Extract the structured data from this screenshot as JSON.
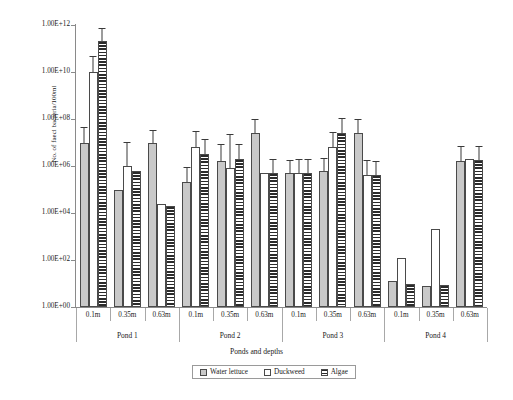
{
  "chart_data": {
    "type": "bar",
    "title": "",
    "xlabel": "Ponds and depths",
    "ylabel": "No. of faecl bacteria/100ml",
    "scale": "log10",
    "ylim": [
      1,
      1000000000000
    ],
    "ytick_labels": [
      "1.00E+12",
      "1.00E+10",
      "1.00E+08",
      "1.00E+06",
      "1.00E+04",
      "1.00E+02",
      "1.00E+00"
    ],
    "ytick_values": [
      1000000000000.0,
      10000000000.0,
      100000000.0,
      1000000.0,
      10000.0,
      100.0,
      1
    ],
    "grid": false,
    "legend_position": "bottom",
    "groups": [
      "Pond 1",
      "Pond 2",
      "Pond 3",
      "Pond 4"
    ],
    "depths": [
      "0.1m",
      "0.35m",
      "0.63m"
    ],
    "categories": [
      "Pond 1 0.1m",
      "Pond 1 0.35m",
      "Pond 1 0.63m",
      "Pond 2 0.1m",
      "Pond 2 0.35m",
      "Pond 2 0.63m",
      "Pond 3 0.1m",
      "Pond 3 0.35m",
      "Pond 3 0.63m",
      "Pond 4 0.1m",
      "Pond 4 0.35m",
      "Pond 4 0.63m"
    ],
    "series": [
      {
        "name": "Water lettuce",
        "pattern": "solid-gray",
        "color": "#c9c9c9",
        "log_values": [
          7.0,
          5.0,
          7.0,
          5.3,
          6.2,
          7.4,
          5.7,
          5.8,
          7.4,
          1.1,
          0.9,
          6.2
        ],
        "values": [
          10000000.0,
          100000.0,
          10000000.0,
          200000.0,
          1600000.0,
          25000000.0,
          500000.0,
          630000.0,
          25000000.0,
          12,
          8,
          1600000.0
        ],
        "err_up_log": [
          0.6,
          0.0,
          0.5,
          0.6,
          0.7,
          0.55,
          0.5,
          0.5,
          0.55,
          0.0,
          0.0,
          0.6
        ]
      },
      {
        "name": "Duckweed",
        "pattern": "open-white",
        "color": "#ffffff",
        "log_values": [
          10.0,
          6.0,
          4.4,
          6.8,
          5.9,
          5.7,
          5.7,
          6.8,
          5.6,
          2.1,
          3.3,
          6.3
        ],
        "values": [
          10000000000.0,
          1000000.0,
          25000.0,
          6300000.0,
          800000.0,
          500000.0,
          500000.0,
          6300000.0,
          400000.0,
          126,
          2000,
          2000000.0
        ],
        "err_up_log": [
          0.65,
          1.0,
          0.0,
          0.65,
          1.4,
          0.0,
          0.55,
          0.6,
          0.6,
          0.0,
          0.0,
          0.0
        ]
      },
      {
        "name": "Algae",
        "pattern": "horizontal-stripes",
        "color": "#2b2b2b",
        "log_values": [
          11.3,
          5.8,
          4.3,
          6.5,
          6.3,
          5.7,
          5.7,
          7.4,
          5.6,
          1.0,
          0.95,
          6.25
        ],
        "values": [
          200000000000.0,
          630000.0,
          20000.0,
          3200000.0,
          2000000.0,
          500000.0,
          500000.0,
          25000000.0,
          400000.0,
          10,
          9,
          1800000.0
        ],
        "err_up_log": [
          0.55,
          0.0,
          0.0,
          0.6,
          0.6,
          0.55,
          0.55,
          0.6,
          0.55,
          0.0,
          0.0,
          0.55
        ]
      }
    ]
  },
  "axis": {
    "y_title": "No. of faecl bacteria/100ml",
    "x_title": "Ponds and depths"
  },
  "legend": {
    "items": [
      {
        "label": "Water lettuce"
      },
      {
        "label": "Duckweed"
      },
      {
        "label": "Algae"
      }
    ]
  }
}
